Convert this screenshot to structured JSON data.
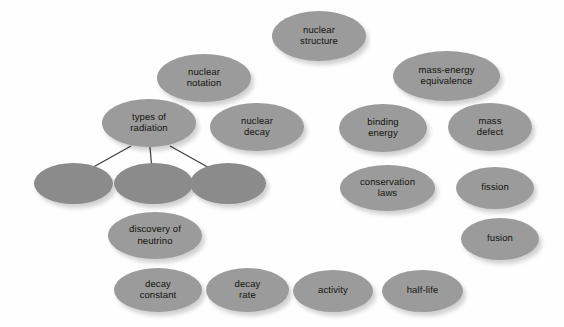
{
  "diagram": {
    "background_color": "#fefefe",
    "node_fill_color": "#9b9b9b",
    "empty_node_fill_color": "#8b8b8b",
    "edge_color": "#3c3c3c",
    "text_color": "#14140f",
    "nodes": [
      {
        "id": "nuclear-structure",
        "label": "nuclear\nstructure",
        "x": 272,
        "y": 11,
        "w": 94,
        "h": 50,
        "empty": false
      },
      {
        "id": "nuclear-notation",
        "label": "nuclear\nnotation",
        "x": 157,
        "y": 54,
        "w": 94,
        "h": 48,
        "empty": false
      },
      {
        "id": "mass-energy-equivalence",
        "label": "mass-energy\nequivalence",
        "x": 393,
        "y": 51,
        "w": 107,
        "h": 50,
        "empty": false
      },
      {
        "id": "types-of-radiation",
        "label": "types of\nradiation",
        "x": 102,
        "y": 99,
        "w": 94,
        "h": 48,
        "empty": false
      },
      {
        "id": "nuclear-decay",
        "label": "nuclear\ndecay",
        "x": 210,
        "y": 103,
        "w": 94,
        "h": 48,
        "empty": false
      },
      {
        "id": "binding-energy",
        "label": "binding\nenergy",
        "x": 339,
        "y": 104,
        "w": 88,
        "h": 48,
        "empty": false
      },
      {
        "id": "mass-defect",
        "label": "mass\ndefect",
        "x": 448,
        "y": 103,
        "w": 84,
        "h": 48,
        "empty": false
      },
      {
        "id": "radiation-type-1",
        "label": "",
        "x": 34,
        "y": 163,
        "w": 79,
        "h": 41,
        "empty": true
      },
      {
        "id": "radiation-type-2",
        "label": "",
        "x": 114,
        "y": 163,
        "w": 79,
        "h": 41,
        "empty": true
      },
      {
        "id": "radiation-type-3",
        "label": "",
        "x": 190,
        "y": 163,
        "w": 76,
        "h": 41,
        "empty": true
      },
      {
        "id": "conservation-laws",
        "label": "conservation\nlaws",
        "x": 340,
        "y": 165,
        "w": 95,
        "h": 46,
        "empty": false
      },
      {
        "id": "fission",
        "label": "fission",
        "x": 456,
        "y": 167,
        "w": 78,
        "h": 42,
        "empty": false
      },
      {
        "id": "discovery-of-neutrino",
        "label": "discovery of\nneutrino",
        "x": 108,
        "y": 212,
        "w": 94,
        "h": 47,
        "empty": false
      },
      {
        "id": "fusion",
        "label": "fusion",
        "x": 461,
        "y": 218,
        "w": 78,
        "h": 42,
        "empty": false
      },
      {
        "id": "decay-constant",
        "label": "decay\nconstant",
        "x": 114,
        "y": 268,
        "w": 88,
        "h": 44,
        "empty": false
      },
      {
        "id": "decay-rate",
        "label": "decay\nrate",
        "x": 206,
        "y": 268,
        "w": 83,
        "h": 44,
        "empty": false
      },
      {
        "id": "activity",
        "label": "activity",
        "x": 293,
        "y": 270,
        "w": 80,
        "h": 42,
        "empty": false
      },
      {
        "id": "half-life",
        "label": "half-life",
        "x": 382,
        "y": 270,
        "w": 81,
        "h": 42,
        "empty": false
      }
    ],
    "edges": [
      {
        "id": "edge-types-to-type1",
        "from": "types-of-radiation",
        "to": "radiation-type-1",
        "x1": 131,
        "y1": 146,
        "x2": 88,
        "y2": 170
      },
      {
        "id": "edge-types-to-type2",
        "from": "types-of-radiation",
        "to": "radiation-type-2",
        "x1": 150,
        "y1": 147,
        "x2": 152,
        "y2": 170
      },
      {
        "id": "edge-types-to-type3",
        "from": "types-of-radiation",
        "to": "radiation-type-3",
        "x1": 170,
        "y1": 146,
        "x2": 213,
        "y2": 170
      }
    ]
  }
}
